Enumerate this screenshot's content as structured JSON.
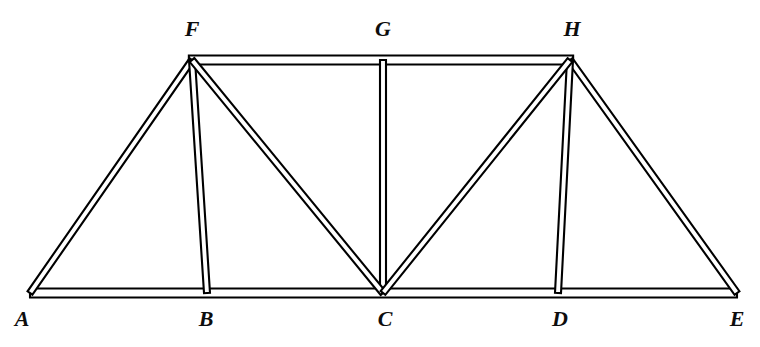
{
  "figure": {
    "background_color": "#ffffff",
    "line_color": "#000000",
    "fill_color": "#ffffff",
    "width": 760,
    "height": 347
  },
  "nodes": [
    {
      "id": "A",
      "label": "A",
      "x": 30,
      "y": 293,
      "label_x": 22,
      "label_y": 308,
      "chord": "bottom"
    },
    {
      "id": "B",
      "label": "B",
      "x": 207,
      "y": 293,
      "label_x": 206,
      "label_y": 308,
      "chord": "bottom"
    },
    {
      "id": "C",
      "label": "C",
      "x": 383,
      "y": 293,
      "label_x": 385,
      "label_y": 308,
      "chord": "bottom"
    },
    {
      "id": "D",
      "label": "D",
      "x": 558,
      "y": 293,
      "label_x": 560,
      "label_y": 308,
      "chord": "bottom"
    },
    {
      "id": "E",
      "label": "E",
      "x": 737,
      "y": 293,
      "label_x": 737,
      "label_y": 308,
      "chord": "bottom"
    },
    {
      "id": "F",
      "label": "F",
      "x": 192,
      "y": 60,
      "label_x": 192,
      "label_y": 18,
      "chord": "top"
    },
    {
      "id": "G",
      "label": "G",
      "x": 383,
      "y": 60,
      "label_x": 383,
      "label_y": 18,
      "chord": "top"
    },
    {
      "id": "H",
      "label": "H",
      "x": 570,
      "y": 60,
      "label_x": 572,
      "label_y": 18,
      "chord": "top"
    }
  ],
  "members": [
    {
      "id": "AE",
      "from": "A",
      "to": "E",
      "type": "bottom-chord",
      "band_width": 9
    },
    {
      "id": "FH",
      "from": "F",
      "to": "H",
      "type": "top-chord",
      "band_width": 9
    },
    {
      "id": "AF",
      "from": "A",
      "to": "F",
      "type": "end-post",
      "band_width": 6
    },
    {
      "id": "EH",
      "from": "E",
      "to": "H",
      "type": "end-post",
      "band_width": 6
    },
    {
      "id": "FB",
      "from": "F",
      "to": "B",
      "type": "vertical",
      "band_width": 6
    },
    {
      "id": "GC",
      "from": "G",
      "to": "C",
      "type": "vertical",
      "band_width": 6
    },
    {
      "id": "HD",
      "from": "H",
      "to": "D",
      "type": "vertical",
      "band_width": 6
    },
    {
      "id": "FC",
      "from": "F",
      "to": "C",
      "type": "diagonal",
      "band_width": 6
    },
    {
      "id": "HC",
      "from": "H",
      "to": "C",
      "type": "diagonal",
      "band_width": 6
    }
  ]
}
